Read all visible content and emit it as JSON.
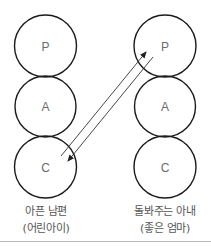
{
  "diagram": {
    "type": "transactional-analysis-ego-states",
    "left_person": {
      "states": [
        "P",
        "A",
        "C"
      ],
      "label_line1": "아픈 남편",
      "label_line2": "(어린아이)"
    },
    "right_person": {
      "states": [
        "P",
        "A",
        "C"
      ],
      "label_line1": "돌봐주는 아내",
      "label_line2": "(좋은 엄마)"
    },
    "transactions": [
      {
        "from": "left.C",
        "to": "right.P",
        "direction": "up"
      },
      {
        "from": "right.P",
        "to": "left.C",
        "direction": "down"
      }
    ],
    "colors": {
      "circle_stroke": "#1a1a1a",
      "letter": "#6b6b6b",
      "arrow": "#333333",
      "label": "#555555",
      "divider": "#b8b8b8"
    }
  }
}
